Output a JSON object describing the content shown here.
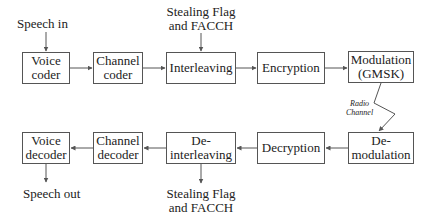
{
  "diagram": {
    "transmit_chain": [
      {
        "id": "voice-coder",
        "label": "Voice\ncoder"
      },
      {
        "id": "channel-coder",
        "label": "Channel\ncoder"
      },
      {
        "id": "interleaving",
        "label": "Interleaving"
      },
      {
        "id": "encryption",
        "label": "Encryption"
      },
      {
        "id": "modulation",
        "label": "Modulation\n(GMSK)"
      }
    ],
    "receive_chain": [
      {
        "id": "demodulation",
        "label": "De-\nmodulation"
      },
      {
        "id": "decryption",
        "label": "Decryption"
      },
      {
        "id": "deinterleaving",
        "label": "De-\ninterleaving"
      },
      {
        "id": "channel-decoder",
        "label": "Channel\ndecoder"
      },
      {
        "id": "voice-decoder",
        "label": "Voice\ndecoder"
      }
    ],
    "inputs": {
      "speech_in": "Speech in",
      "stealing_in": "Stealing Flag\nand FACCH"
    },
    "outputs": {
      "speech_out": "Speech out",
      "stealing_out": "Stealing Flag\nand FACCH"
    },
    "channel": {
      "label": "Radio\nChannel"
    },
    "colors": {
      "line": "#555555",
      "text": "#222222",
      "background": "#ffffff"
    }
  }
}
